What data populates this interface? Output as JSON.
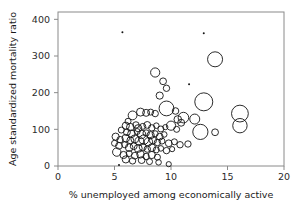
{
  "figure": {
    "kind": "bubble-scatter-plot",
    "background_color": "#ffffff",
    "frame_color": "#8a8a8a",
    "marker_color": "#141414"
  },
  "chart_data": {
    "type": "scatter",
    "title": "",
    "subtitle": "",
    "xlabel": "% unemployed among economically active",
    "ylabel": "Age standardized mortality ratio",
    "xlim": [
      0,
      20
    ],
    "ylim": [
      0,
      420
    ],
    "xticks": [
      0,
      5,
      10,
      15,
      20
    ],
    "yticks": [
      0,
      100,
      200,
      300,
      400
    ],
    "xtick_labels": [
      "0",
      "5",
      "10",
      "15",
      "20"
    ],
    "ytick_labels": [
      "0",
      "100",
      "200",
      "300",
      "400"
    ],
    "grid": false,
    "legend": null,
    "marker_style": "open-circle",
    "size_encodes": "population size",
    "points": [
      {
        "x": 5.7,
        "y": 365,
        "r": 1.2
      },
      {
        "x": 12.9,
        "y": 362,
        "r": 0.9
      },
      {
        "x": 13.9,
        "y": 291,
        "r": 7.5
      },
      {
        "x": 8.6,
        "y": 255,
        "r": 4.6
      },
      {
        "x": 9.3,
        "y": 231,
        "r": 3.4
      },
      {
        "x": 11.6,
        "y": 223,
        "r": 1.3
      },
      {
        "x": 9.6,
        "y": 212,
        "r": 3.2
      },
      {
        "x": 9.0,
        "y": 192,
        "r": 3.6
      },
      {
        "x": 12.9,
        "y": 175,
        "r": 9.0
      },
      {
        "x": 16.1,
        "y": 143,
        "r": 8.4
      },
      {
        "x": 16.1,
        "y": 110,
        "r": 7.2
      },
      {
        "x": 9.6,
        "y": 157,
        "r": 7.4
      },
      {
        "x": 10.4,
        "y": 150,
        "r": 3.3
      },
      {
        "x": 7.3,
        "y": 147,
        "r": 4.0
      },
      {
        "x": 7.8,
        "y": 145,
        "r": 3.5
      },
      {
        "x": 8.2,
        "y": 147,
        "r": 3.0
      },
      {
        "x": 8.6,
        "y": 143,
        "r": 3.2
      },
      {
        "x": 6.6,
        "y": 138,
        "r": 4.4
      },
      {
        "x": 11.1,
        "y": 132,
        "r": 5.3
      },
      {
        "x": 12.1,
        "y": 128,
        "r": 5.0
      },
      {
        "x": 10.6,
        "y": 127,
        "r": 3.8
      },
      {
        "x": 10.9,
        "y": 118,
        "r": 3.5
      },
      {
        "x": 12.6,
        "y": 93,
        "r": 7.6
      },
      {
        "x": 13.9,
        "y": 92,
        "r": 3.4
      },
      {
        "x": 11.5,
        "y": 60,
        "r": 3.2
      },
      {
        "x": 6.2,
        "y": 122,
        "r": 3.0
      },
      {
        "x": 6.0,
        "y": 110,
        "r": 3.6
      },
      {
        "x": 6.4,
        "y": 106,
        "r": 3.8
      },
      {
        "x": 6.9,
        "y": 112,
        "r": 3.2
      },
      {
        "x": 7.1,
        "y": 103,
        "r": 3.6
      },
      {
        "x": 7.5,
        "y": 108,
        "r": 3.0
      },
      {
        "x": 7.9,
        "y": 112,
        "r": 3.4
      },
      {
        "x": 8.3,
        "y": 104,
        "r": 3.2
      },
      {
        "x": 8.7,
        "y": 110,
        "r": 2.8
      },
      {
        "x": 9.1,
        "y": 101,
        "r": 3.0
      },
      {
        "x": 9.5,
        "y": 106,
        "r": 2.6
      },
      {
        "x": 10.0,
        "y": 110,
        "r": 4.6
      },
      {
        "x": 10.5,
        "y": 100,
        "r": 3.0
      },
      {
        "x": 5.6,
        "y": 98,
        "r": 3.0
      },
      {
        "x": 6.1,
        "y": 92,
        "r": 3.4
      },
      {
        "x": 6.5,
        "y": 88,
        "r": 3.8
      },
      {
        "x": 7.0,
        "y": 94,
        "r": 3.0
      },
      {
        "x": 7.4,
        "y": 86,
        "r": 4.2
      },
      {
        "x": 7.8,
        "y": 90,
        "r": 3.2
      },
      {
        "x": 8.2,
        "y": 84,
        "r": 3.6
      },
      {
        "x": 8.6,
        "y": 88,
        "r": 3.0
      },
      {
        "x": 9.0,
        "y": 80,
        "r": 3.4
      },
      {
        "x": 9.4,
        "y": 86,
        "r": 2.8
      },
      {
        "x": 5.1,
        "y": 80,
        "r": 3.6
      },
      {
        "x": 5.5,
        "y": 72,
        "r": 3.2
      },
      {
        "x": 6.0,
        "y": 76,
        "r": 3.8
      },
      {
        "x": 6.4,
        "y": 70,
        "r": 3.4
      },
      {
        "x": 6.8,
        "y": 74,
        "r": 4.0
      },
      {
        "x": 7.2,
        "y": 68,
        "r": 4.4
      },
      {
        "x": 7.6,
        "y": 72,
        "r": 4.8
      },
      {
        "x": 8.0,
        "y": 66,
        "r": 4.2
      },
      {
        "x": 8.4,
        "y": 70,
        "r": 3.6
      },
      {
        "x": 8.8,
        "y": 64,
        "r": 3.2
      },
      {
        "x": 9.2,
        "y": 68,
        "r": 3.0
      },
      {
        "x": 9.8,
        "y": 62,
        "r": 3.4
      },
      {
        "x": 10.3,
        "y": 66,
        "r": 3.0
      },
      {
        "x": 10.8,
        "y": 58,
        "r": 3.2
      },
      {
        "x": 5.0,
        "y": 62,
        "r": 3.0
      },
      {
        "x": 5.4,
        "y": 55,
        "r": 3.4
      },
      {
        "x": 5.9,
        "y": 58,
        "r": 3.0
      },
      {
        "x": 6.3,
        "y": 50,
        "r": 3.8
      },
      {
        "x": 6.7,
        "y": 54,
        "r": 3.4
      },
      {
        "x": 7.1,
        "y": 48,
        "r": 4.0
      },
      {
        "x": 7.5,
        "y": 52,
        "r": 3.6
      },
      {
        "x": 7.9,
        "y": 46,
        "r": 3.2
      },
      {
        "x": 8.3,
        "y": 50,
        "r": 3.8
      },
      {
        "x": 8.7,
        "y": 44,
        "r": 3.0
      },
      {
        "x": 9.1,
        "y": 48,
        "r": 2.8
      },
      {
        "x": 9.6,
        "y": 42,
        "r": 3.2
      },
      {
        "x": 10.1,
        "y": 46,
        "r": 2.6
      },
      {
        "x": 5.2,
        "y": 38,
        "r": 4.2
      },
      {
        "x": 5.8,
        "y": 30,
        "r": 3.6
      },
      {
        "x": 6.3,
        "y": 34,
        "r": 3.0
      },
      {
        "x": 6.8,
        "y": 28,
        "r": 3.4
      },
      {
        "x": 7.3,
        "y": 32,
        "r": 3.8
      },
      {
        "x": 7.8,
        "y": 26,
        "r": 3.2
      },
      {
        "x": 8.3,
        "y": 30,
        "r": 3.6
      },
      {
        "x": 8.8,
        "y": 24,
        "r": 3.0
      },
      {
        "x": 6.0,
        "y": 18,
        "r": 3.6
      },
      {
        "x": 6.6,
        "y": 14,
        "r": 3.2
      },
      {
        "x": 7.4,
        "y": 16,
        "r": 3.4
      },
      {
        "x": 8.1,
        "y": 12,
        "r": 3.0
      },
      {
        "x": 8.9,
        "y": 10,
        "r": 2.8
      },
      {
        "x": 9.8,
        "y": 5,
        "r": 2.6
      },
      {
        "x": 5.4,
        "y": 3,
        "r": 1.1
      }
    ]
  }
}
